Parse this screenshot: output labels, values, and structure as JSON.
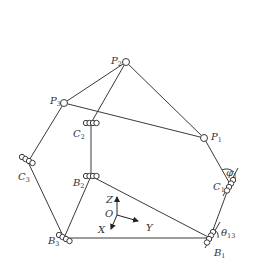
{
  "diagram": {
    "type": "parallel-mechanism-kinematic-sketch",
    "colors": {
      "line": "#3a3a3a",
      "label": "#333333",
      "background": "#ffffff"
    },
    "nodes": [
      {
        "id": "P1",
        "label": "P",
        "sub": "1",
        "x": 204,
        "y": 138,
        "joint": "spherical",
        "label_x": 211,
        "label_y": 138
      },
      {
        "id": "P2",
        "label": "P",
        "sub": "2",
        "x": 126,
        "y": 62,
        "joint": "spherical",
        "label_x": 111,
        "label_y": 62
      },
      {
        "id": "P3",
        "label": "P",
        "sub": "3",
        "x": 64,
        "y": 103,
        "joint": "spherical",
        "label_x": 50,
        "label_y": 102
      },
      {
        "id": "C1",
        "label": "C",
        "sub": "1",
        "x": 230,
        "y": 184,
        "joint": "cylindrical",
        "label_x": 213,
        "label_y": 188
      },
      {
        "id": "C2",
        "label": "C",
        "sub": "2",
        "x": 91,
        "y": 123,
        "joint": "cylindrical",
        "label_x": 73,
        "label_y": 135
      },
      {
        "id": "C3",
        "label": "C",
        "sub": "3",
        "x": 28,
        "y": 162,
        "joint": "cylindrical",
        "label_x": 18,
        "label_y": 178
      },
      {
        "id": "B1",
        "label": "B",
        "sub": "1",
        "x": 210,
        "y": 238,
        "joint": "cylindrical",
        "label_x": 214,
        "label_y": 255
      },
      {
        "id": "B2",
        "label": "B",
        "sub": "2",
        "x": 91,
        "y": 176,
        "joint": "cylindrical",
        "label_x": 73,
        "label_y": 184
      },
      {
        "id": "B3",
        "label": "B",
        "sub": "3",
        "x": 64,
        "y": 238,
        "joint": "cylindrical",
        "label_x": 49,
        "label_y": 243
      }
    ],
    "edges": [
      [
        "P2",
        "P3"
      ],
      [
        "P2",
        "P1"
      ],
      [
        "P3",
        "P1"
      ],
      [
        "P2",
        "C2"
      ],
      [
        "C2",
        "B2"
      ],
      [
        "P3",
        "C3"
      ],
      [
        "C3",
        "B3"
      ],
      [
        "P1",
        "C1"
      ],
      [
        "C1",
        "B1"
      ],
      [
        "B3",
        "B1"
      ],
      [
        "B2",
        "B1"
      ],
      [
        "B2",
        "B3"
      ]
    ],
    "angles": [
      {
        "label": "φ",
        "sub": "1",
        "at": "C1",
        "label_x": 226,
        "label_y": 176
      },
      {
        "label": "θ",
        "sub": "13",
        "at": "B1",
        "label_x": 221,
        "label_y": 233
      }
    ],
    "axes": {
      "origin": {
        "label": "O",
        "x": 117,
        "y": 215
      },
      "z": {
        "label": "Z"
      },
      "y": {
        "label": "Y"
      },
      "x": {
        "label": "X"
      }
    }
  }
}
